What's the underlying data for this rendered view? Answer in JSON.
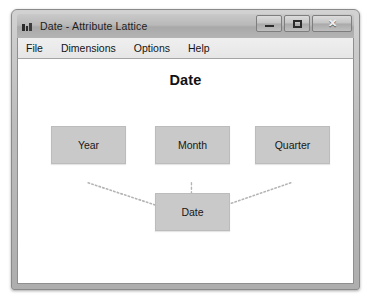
{
  "window": {
    "title": "Date - Attribute Lattice",
    "icon": "app-icon",
    "controls": {
      "minimize_label": "–",
      "maximize_label": "□",
      "close_label": "✕"
    }
  },
  "menubar": {
    "items": [
      {
        "label": "File"
      },
      {
        "label": "Dimensions"
      },
      {
        "label": "Options"
      },
      {
        "label": "Help"
      }
    ]
  },
  "canvas": {
    "title": "Date",
    "nodes": [
      {
        "id": "year",
        "label": "Year"
      },
      {
        "id": "month",
        "label": "Month"
      },
      {
        "id": "quarter",
        "label": "Quarter"
      },
      {
        "id": "date",
        "label": "Date"
      }
    ],
    "edges": [
      {
        "from": "year",
        "to": "date",
        "style": "dotted"
      },
      {
        "from": "month",
        "to": "date",
        "style": "dotted"
      },
      {
        "from": "quarter",
        "to": "date",
        "style": "dotted"
      }
    ]
  },
  "colors": {
    "node_fill": "#c9c9c9",
    "node_border": "#bcbcbc",
    "edge": "#b4b4b4",
    "canvas_bg": "#ffffff",
    "frame": "#bdbdbd"
  }
}
